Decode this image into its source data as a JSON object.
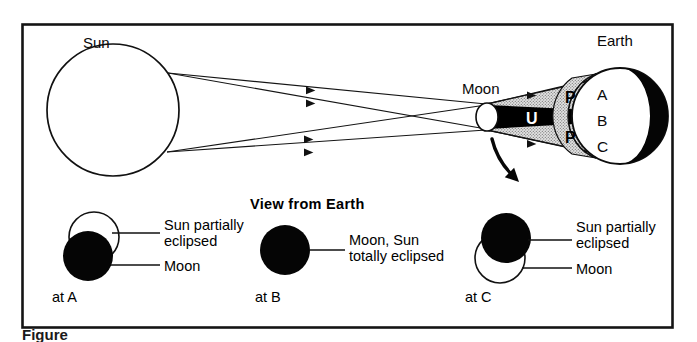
{
  "figure": {
    "background_color": "#ffffff",
    "frame_color": "#141414",
    "ink_color": "#0a0a0a",
    "penumbra_fill": "#d8d8d8",
    "umbra_fill": "#000000",
    "caption": "Figure"
  },
  "top_diagram": {
    "sun_label": "Sun",
    "moon_label": "Moon",
    "earth_label": "Earth",
    "umbra_label": "U",
    "penumbra_label_upper": "P",
    "penumbra_label_lower": "P",
    "earth_points": [
      "A",
      "B",
      "C"
    ],
    "ray_count": 4
  },
  "view_from_earth": {
    "title": "View from Earth",
    "panels": [
      {
        "position_label": "at A",
        "callouts": [
          "Sun partially\neclipsed",
          "Moon"
        ],
        "callout_1_line1": "Sun partially",
        "callout_1_line2": "eclipsed",
        "callout_2": "Moon",
        "sun_state": "partial",
        "moon_state": "black"
      },
      {
        "position_label": "at B",
        "callout_1_line1": "Moon, Sun",
        "callout_1_line2": "totally eclipsed",
        "sun_state": "total",
        "moon_state": "black"
      },
      {
        "position_label": "at C",
        "callout_1_line1": "Sun partially",
        "callout_1_line2": "eclipsed",
        "callout_2": "Moon",
        "sun_state": "partial",
        "moon_state": "black"
      }
    ]
  }
}
